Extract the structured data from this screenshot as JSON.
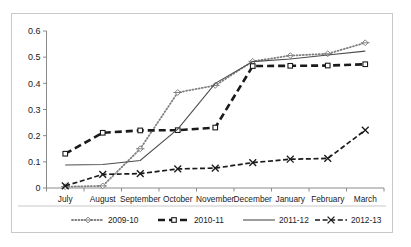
{
  "chart_data": {
    "type": "line",
    "title": "",
    "subtitle": "",
    "xlabel": "",
    "ylabel": "",
    "categories": [
      "July",
      "August",
      "September",
      "October",
      "November",
      "December",
      "January",
      "February",
      "March"
    ],
    "ylim": [
      0,
      0.6
    ],
    "ytick_labels": [
      "0",
      "0.1",
      "0.2",
      "0.3",
      "0.4",
      "0.5",
      "0.6"
    ],
    "ytick_values": [
      0,
      0.1,
      0.2,
      0.3,
      0.4,
      0.5,
      0.6
    ],
    "grid": false,
    "legend_position": "bottom",
    "series": [
      {
        "name": "2009-10",
        "line_style": "dotted",
        "marker": "diamond",
        "color": "#808080",
        "values": [
          0.005,
          0.008,
          0.15,
          0.365,
          0.392,
          0.484,
          0.506,
          0.513,
          0.555
        ]
      },
      {
        "name": "2010-11",
        "line_style": "dashed",
        "marker": "square",
        "color": "#1a1a1a",
        "values": [
          0.131,
          0.211,
          0.22,
          0.221,
          0.231,
          0.466,
          0.467,
          0.468,
          0.473
        ]
      },
      {
        "name": "2011-12",
        "line_style": "solid",
        "marker": "none",
        "color": "#4d4d4d",
        "values": [
          0.088,
          0.09,
          0.105,
          0.225,
          0.4,
          0.483,
          0.493,
          0.508,
          0.523
        ]
      },
      {
        "name": "2012-13",
        "line_style": "dashdot",
        "marker": "x",
        "color": "#1a1a1a",
        "values": [
          0.008,
          0.052,
          0.055,
          0.073,
          0.076,
          0.097,
          0.11,
          0.113,
          0.221
        ]
      }
    ]
  },
  "axes": {
    "y_axis_name": "value-axis",
    "x_axis_name": "month-axis"
  },
  "legend": {
    "items": [
      {
        "label": "2009-10",
        "style": "dotted-diamond"
      },
      {
        "label": "2010-11",
        "style": "dashed-square"
      },
      {
        "label": "2011-12",
        "style": "solid"
      },
      {
        "label": "2012-13",
        "style": "dashdot-x"
      }
    ]
  }
}
